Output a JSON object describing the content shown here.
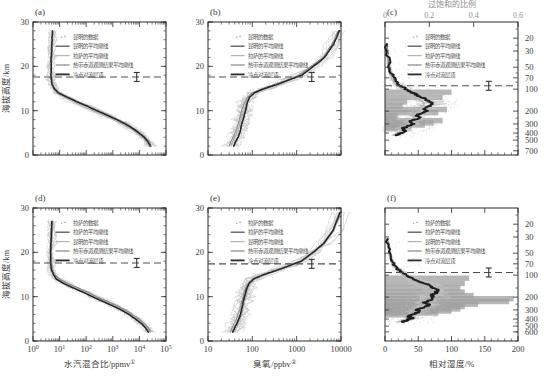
{
  "figure": {
    "panels": [
      "(a)",
      "(b)",
      "(c)",
      "(d)",
      "(e)",
      "(f)"
    ],
    "axis_titles": {
      "altitude": "海拔高度/km",
      "water_vapour": "水汽混合比/ppmv",
      "ozone": "臭氧/ppbv",
      "relative_humidity": "相对湿度/%",
      "pressure": "气压/hPa",
      "supersaturation": "过饱和的比例"
    },
    "footnote_marks": {
      "water_vapour": "①",
      "ozone": "②"
    }
  },
  "legend_kunming": [
    {
      "label": "昆明的数据",
      "style": "dots",
      "color": "#a9a9a9"
    },
    {
      "label": "昆明的平均廓线",
      "style": "line",
      "color": "#545454"
    },
    {
      "label": "拉萨的平均廓线",
      "style": "line",
      "color": "#b5b5b5"
    },
    {
      "label": "热带赤道观测结果平均廓线",
      "style": "line",
      "color": "#8e8e8e"
    },
    {
      "label": "冷点对流层顶",
      "style": "line",
      "color": "#2b2b2b"
    }
  ],
  "legend_lhasa": [
    {
      "label": "拉萨的数据",
      "style": "dots",
      "color": "#a9a9a9"
    },
    {
      "label": "拉萨的平均廓线",
      "style": "line",
      "color": "#545454"
    },
    {
      "label": "昆明的平均廓线",
      "style": "line",
      "color": "#b5b5b5"
    },
    {
      "label": "热带赤道观测结果平均廓线",
      "style": "line",
      "color": "#8e8e8e"
    },
    {
      "label": "冷点对流层顶",
      "style": "line",
      "color": "#2b2b2b"
    }
  ],
  "chart_data": [
    {
      "id": "a",
      "type": "line",
      "panel": "(a)",
      "title": "",
      "xlabel": "水汽混合比/ppmv",
      "ylabel": "海拔高度/km",
      "xscale": "log",
      "xlim": [
        1,
        100000
      ],
      "ylim": [
        0,
        30
      ],
      "xticks": [
        "10^0",
        "10^1",
        "10^2",
        "10^3",
        "10^4",
        "10^5"
      ],
      "yticks": [
        0,
        10,
        20,
        30
      ],
      "cold_point_tropopause_km": 17.6,
      "cpt_errorbar_km": 0.6,
      "series": [
        {
          "name": "昆明的平均廓线",
          "x": [
            26000,
            21000,
            15000,
            9500,
            5500,
            3000,
            1400,
            600,
            250,
            110,
            45,
            20,
            9,
            6.2,
            5.2,
            4.9,
            4.8,
            4.8,
            4.9,
            5.0,
            5.2,
            5.4
          ],
          "y": [
            2,
            3,
            4,
            5,
            6,
            7,
            8,
            9,
            10,
            11,
            12,
            13,
            14,
            15,
            16,
            17,
            18,
            20,
            22,
            24,
            26,
            28
          ]
        },
        {
          "name": "拉萨的平均廓线",
          "x": [
            23000,
            18000,
            12500,
            7800,
            4400,
            2300,
            1050,
            430,
            180,
            80,
            33,
            15,
            8,
            6.0,
            5.1,
            4.8,
            4.7,
            4.7,
            4.8,
            5.0,
            5.1,
            5.3
          ],
          "y": [
            2,
            3,
            4,
            5,
            6,
            7,
            8,
            9,
            10,
            11,
            12,
            13,
            14,
            15,
            16,
            17,
            18,
            20,
            22,
            24,
            26,
            28
          ]
        },
        {
          "name": "热带赤道观测结果平均廓线",
          "x": [
            28000,
            23000,
            16500,
            10500,
            6200,
            3400,
            1600,
            700,
            290,
            125,
            50,
            22,
            10,
            6.4,
            5.3,
            5.0,
            4.9,
            4.9,
            5.0,
            5.1,
            5.3,
            5.5
          ],
          "y": [
            2,
            3,
            4,
            5,
            6,
            7,
            8,
            9,
            10,
            11,
            12,
            13,
            14,
            15,
            16,
            17,
            18,
            20,
            22,
            24,
            26,
            28
          ]
        }
      ]
    },
    {
      "id": "b",
      "type": "line",
      "panel": "(b)",
      "xlabel": "臭氧/ppbv",
      "ylabel": "海拔高度/km",
      "xscale": "log",
      "xlim": [
        10,
        10000
      ],
      "ylim": [
        0,
        30
      ],
      "xticks": [
        "10",
        "100",
        "1000",
        "10000"
      ],
      "yticks": [
        0,
        10,
        20,
        30
      ],
      "cold_point_tropopause_km": 17.6,
      "series": [
        {
          "name": "昆明的平均廓线",
          "x": [
            38,
            42,
            48,
            52,
            55,
            58,
            62,
            66,
            70,
            74,
            78,
            86,
            110,
            190,
            380,
            700,
            1300,
            2400,
            4200,
            6800,
            9200
          ],
          "y": [
            2,
            3,
            4,
            5,
            6,
            7,
            8,
            9,
            10,
            11,
            12,
            13,
            14,
            15,
            16,
            17,
            18,
            20,
            22,
            25,
            28
          ]
        },
        {
          "name": "拉萨的平均廓线",
          "x": [
            33,
            36,
            40,
            45,
            49,
            52,
            55,
            59,
            63,
            68,
            73,
            82,
            105,
            180,
            360,
            660,
            1200,
            2250,
            4000,
            6500,
            9000
          ],
          "y": [
            2,
            3,
            4,
            5,
            6,
            7,
            8,
            9,
            10,
            11,
            12,
            13,
            14,
            15,
            16,
            17,
            18,
            20,
            22,
            25,
            28
          ]
        },
        {
          "name": "热带赤道观测结果平均廓线",
          "x": [
            30,
            33,
            37,
            41,
            45,
            48,
            51,
            54,
            58,
            62,
            68,
            78,
            100,
            170,
            340,
            640,
            1150,
            2150,
            3900,
            6300,
            8800
          ],
          "y": [
            2,
            3,
            4,
            5,
            6,
            7,
            8,
            9,
            10,
            11,
            12,
            13,
            14,
            15,
            16,
            17,
            18,
            20,
            22,
            25,
            28
          ]
        }
      ]
    },
    {
      "id": "c",
      "type": "line",
      "panel": "(c)",
      "xlabel": "相对湿度/%",
      "ylabel": "气压/hPa",
      "toplabel": "过饱和的比例",
      "xlim": [
        0,
        200
      ],
      "xticks": [
        0,
        50,
        100,
        150,
        200
      ],
      "toplim": [
        0,
        0.6
      ],
      "topticks": [
        0,
        0.2,
        0.4,
        0.6
      ],
      "yscale": "log-pressure",
      "yticks": [
        20,
        30,
        50,
        70,
        100,
        200,
        300,
        400,
        500,
        700
      ],
      "cold_point_tropopause_hPa": 90,
      "series": [
        {
          "name": "昆明的平均廓线 (RH)",
          "x": [
            18,
            24,
            31,
            27,
            35,
            42,
            38,
            46,
            52,
            48,
            56,
            62,
            58,
            65,
            72,
            68,
            60,
            52,
            45,
            38,
            30,
            22,
            14,
            9,
            6,
            4,
            3
          ],
          "y": [
            430,
            400,
            370,
            345,
            320,
            300,
            280,
            262,
            244,
            228,
            212,
            198,
            184,
            172,
            160,
            148,
            136,
            126,
            116,
            106,
            98,
            88,
            74,
            60,
            46,
            34,
            24
          ]
        },
        {
          "name": "拉萨的平均廓线 (RH)",
          "x": [
            12,
            18,
            24,
            20,
            28,
            34,
            30,
            38,
            44,
            40,
            47,
            53,
            49,
            55,
            60,
            56,
            50,
            43,
            37,
            31,
            24,
            17,
            11,
            7,
            5,
            3,
            2
          ],
          "y": [
            430,
            400,
            370,
            345,
            320,
            300,
            280,
            262,
            244,
            228,
            212,
            198,
            184,
            172,
            160,
            148,
            136,
            126,
            116,
            106,
            98,
            88,
            74,
            60,
            46,
            34,
            24
          ]
        }
      ],
      "supersaturation_histogram": {
        "bins_hPa": [
          110,
          130,
          150,
          170,
          190,
          210,
          230,
          250,
          270,
          290,
          310,
          330,
          350
        ],
        "fraction": [
          0.3,
          0.26,
          0.1,
          0.08,
          0.28,
          0.24,
          0.06,
          0.05,
          0.26,
          0.22,
          0.18,
          0.12,
          0.06
        ]
      }
    },
    {
      "id": "d",
      "type": "line",
      "panel": "(d)",
      "xlabel": "水汽混合比/ppmv",
      "ylabel": "海拔高度/km",
      "xscale": "log",
      "xlim": [
        1,
        100000
      ],
      "ylim": [
        0,
        30
      ],
      "xticks": [
        "10^0",
        "10^1",
        "10^2",
        "10^3",
        "10^4",
        "10^5"
      ],
      "yticks": [
        0,
        10,
        20,
        30
      ],
      "cold_point_tropopause_km": 17.6,
      "series": [
        {
          "name": "拉萨的平均廓线",
          "x": [
            22000,
            17000,
            11500,
            7000,
            4000,
            2100,
            950,
            400,
            170,
            76,
            32,
            14,
            7.5,
            5.8,
            5.0,
            4.7,
            4.6,
            4.6,
            4.7,
            4.9,
            5.0,
            5.2
          ],
          "y": [
            2,
            3,
            4,
            5,
            6,
            7,
            8,
            9,
            10,
            11,
            12,
            13,
            14,
            15,
            16,
            17,
            18,
            20,
            22,
            24,
            26,
            27
          ]
        },
        {
          "name": "昆明的平均廓线",
          "x": [
            25000,
            19500,
            13500,
            8400,
            4900,
            2600,
            1200,
            500,
            215,
            95,
            40,
            18,
            8.8,
            6.1,
            5.2,
            4.9,
            4.8,
            4.8,
            4.9,
            5.0,
            5.2,
            5.4
          ],
          "y": [
            2,
            3,
            4,
            5,
            6,
            7,
            8,
            9,
            10,
            11,
            12,
            13,
            14,
            15,
            16,
            17,
            18,
            20,
            22,
            24,
            26,
            27
          ]
        },
        {
          "name": "热带赤道观测结果平均廓线",
          "x": [
            27000,
            21500,
            15000,
            9300,
            5500,
            3000,
            1400,
            600,
            255,
            115,
            48,
            21,
            9.8,
            6.4,
            5.4,
            5.0,
            4.9,
            4.9,
            5.0,
            5.2,
            5.3,
            5.5
          ],
          "y": [
            2,
            3,
            4,
            5,
            6,
            7,
            8,
            9,
            10,
            11,
            12,
            13,
            14,
            15,
            16,
            17,
            18,
            20,
            22,
            24,
            26,
            27
          ]
        }
      ]
    },
    {
      "id": "e",
      "type": "line",
      "panel": "(e)",
      "xlabel": "臭氧/ppbv",
      "ylabel": "海拔高度/km",
      "xscale": "log",
      "xlim": [
        10,
        10000
      ],
      "ylim": [
        0,
        30
      ],
      "xticks": [
        "10",
        "100",
        "1000",
        "10000"
      ],
      "yticks": [
        0,
        10,
        20,
        30
      ],
      "cold_point_tropopause_km": 17.4,
      "series": [
        {
          "name": "拉萨的平均廓线",
          "x": [
            36,
            40,
            45,
            50,
            54,
            57,
            60,
            63,
            67,
            71,
            76,
            84,
            108,
            185,
            370,
            690,
            1280,
            2350,
            4100,
            6700,
            9500
          ],
          "y": [
            2,
            3,
            4,
            5,
            6,
            7,
            8,
            9,
            10,
            11,
            12,
            13,
            14,
            15,
            16,
            17,
            18,
            20,
            22,
            25,
            29
          ]
        },
        {
          "name": "昆明的平均廓线",
          "x": [
            40,
            44,
            49,
            54,
            58,
            61,
            64,
            68,
            72,
            77,
            82,
            90,
            115,
            195,
            390,
            720,
            1350,
            2500,
            4300,
            7000,
            9800
          ],
          "y": [
            2,
            3,
            4,
            5,
            6,
            7,
            8,
            9,
            10,
            11,
            12,
            13,
            14,
            15,
            16,
            17,
            18,
            20,
            22,
            25,
            29
          ]
        },
        {
          "name": "热带赤道观测结果平均廓线",
          "x": [
            32,
            35,
            39,
            44,
            48,
            51,
            54,
            58,
            62,
            66,
            71,
            80,
            102,
            175,
            350,
            660,
            1220,
            2250,
            3950,
            6500,
            9200
          ],
          "y": [
            2,
            3,
            4,
            5,
            6,
            7,
            8,
            9,
            10,
            11,
            12,
            13,
            14,
            15,
            16,
            17,
            18,
            20,
            22,
            25,
            29
          ]
        }
      ]
    },
    {
      "id": "f",
      "type": "line",
      "panel": "(f)",
      "xlabel": "相对湿度/%",
      "ylabel": "气压/hPa",
      "xlim": [
        0,
        200
      ],
      "xticks": [
        0,
        50,
        100,
        150,
        200
      ],
      "yscale": "log-pressure",
      "yticks": [
        20,
        30,
        50,
        70,
        100,
        200,
        300,
        400,
        500,
        600
      ],
      "cold_point_tropopause_hPa": 92,
      "series": [
        {
          "name": "拉萨的平均廓线 (RH)",
          "x": [
            26,
            33,
            40,
            36,
            44,
            52,
            48,
            58,
            66,
            60,
            68,
            74,
            70,
            76,
            80,
            74,
            66,
            57,
            48,
            39,
            30,
            22,
            14,
            9,
            6,
            4
          ],
          "y": [
            440,
            415,
            390,
            365,
            340,
            318,
            296,
            276,
            256,
            238,
            220,
            204,
            190,
            176,
            162,
            150,
            138,
            127,
            117,
            107,
            97,
            86,
            72,
            58,
            44,
            32
          ]
        },
        {
          "name": "昆明的平均廓线 (RH)",
          "x": [
            20,
            27,
            34,
            30,
            38,
            45,
            41,
            50,
            57,
            52,
            59,
            65,
            61,
            67,
            71,
            65,
            57,
            49,
            41,
            33,
            25,
            18,
            12,
            8,
            5,
            3
          ],
          "y": [
            440,
            415,
            390,
            365,
            340,
            318,
            296,
            276,
            256,
            238,
            220,
            204,
            190,
            176,
            162,
            150,
            138,
            127,
            117,
            107,
            97,
            86,
            72,
            58,
            44,
            32
          ]
        }
      ],
      "supersaturation_histogram": {
        "bins_hPa": [
          110,
          130,
          150,
          170,
          190,
          210,
          230,
          250,
          270,
          290,
          310,
          330,
          350
        ],
        "fraction": [
          0.38,
          0.36,
          0.34,
          0.36,
          0.4,
          0.58,
          0.56,
          0.42,
          0.36,
          0.34,
          0.3,
          0.24,
          0.14
        ]
      }
    }
  ]
}
